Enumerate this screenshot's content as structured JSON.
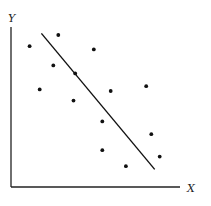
{
  "chart_data": {
    "type": "scatter",
    "title": "",
    "xlabel": "X",
    "ylabel": "Y",
    "xlim": [
      0,
      100
    ],
    "ylim": [
      0,
      100
    ],
    "grid": false,
    "legend": null,
    "x_ticks": [],
    "y_ticks": [],
    "series": [
      {
        "name": "observations",
        "points": [
          {
            "x": 11,
            "y": 88
          },
          {
            "x": 28,
            "y": 95
          },
          {
            "x": 49,
            "y": 86
          },
          {
            "x": 25,
            "y": 76
          },
          {
            "x": 38,
            "y": 71
          },
          {
            "x": 17,
            "y": 61
          },
          {
            "x": 59,
            "y": 60
          },
          {
            "x": 80,
            "y": 63
          },
          {
            "x": 37,
            "y": 54
          },
          {
            "x": 54,
            "y": 41
          },
          {
            "x": 83,
            "y": 33
          },
          {
            "x": 54,
            "y": 23
          },
          {
            "x": 88,
            "y": 19
          },
          {
            "x": 68,
            "y": 13
          }
        ]
      }
    ],
    "trend_line": {
      "name": "fitted line (negative slope)",
      "start": {
        "x": 18,
        "y": 96
      },
      "end": {
        "x": 85,
        "y": 11
      }
    }
  },
  "style": {
    "ink_color": "#111111",
    "background": "#ffffff"
  }
}
